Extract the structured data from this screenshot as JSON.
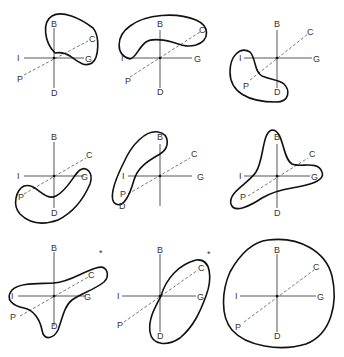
{
  "axis_labels": {
    "up": "B",
    "down": "D",
    "left": "I",
    "right": "G",
    "diag_up": "C",
    "diag_down": "P"
  },
  "panels": [
    {
      "id": 1,
      "marker": ""
    },
    {
      "id": 2,
      "marker": ""
    },
    {
      "id": 3,
      "marker": ""
    },
    {
      "id": 4,
      "marker": ""
    },
    {
      "id": 5,
      "marker": ""
    },
    {
      "id": 6,
      "marker": ""
    },
    {
      "id": 7,
      "marker": "*"
    },
    {
      "id": 8,
      "marker": "*"
    },
    {
      "id": 9,
      "marker": ""
    }
  ],
  "colors": {
    "line": "#111111",
    "axis": "#444444",
    "background": "#ffffff"
  }
}
